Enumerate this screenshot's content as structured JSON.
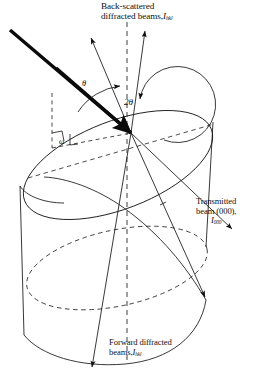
{
  "figure": {
    "background_color": "#ffffff",
    "line_color": "#101010",
    "width": 254,
    "height": 380
  },
  "labels": {
    "backscattered": {
      "line1": "Back-scattered",
      "line2": "diffracted beams,",
      "symbol": "I",
      "subscript": "hkl"
    },
    "transmitted": {
      "line1": "Transmitted",
      "line2": "beam (000),",
      "symbol": "I",
      "subscript": "000"
    },
    "forward": {
      "line1": "Forward diffracted",
      "line2": "beams,",
      "symbol": "I",
      "subscript": "hkl"
    }
  },
  "angles": {
    "theta": "θ",
    "two_theta": "2θ",
    "omega": "ω"
  },
  "beams": {
    "incident": {
      "name": "incident-beam",
      "style": "thick-solid-arrow",
      "from": [
        10,
        30
      ],
      "to": [
        131,
        133
      ]
    },
    "backscattered_left": {
      "name": "backscattered-beam-left",
      "style": "thin-solid-arrow",
      "from": [
        131,
        133
      ],
      "to": [
        91,
        38
      ]
    },
    "backscattered_right": {
      "name": "backscattered-beam-right",
      "style": "thin-solid-arrow",
      "from": [
        131,
        133
      ],
      "to": [
        145,
        31
      ]
    },
    "transmitted": {
      "name": "transmitted-beam-000",
      "style": "thin-solid-arrow",
      "from": [
        131,
        133
      ],
      "to": [
        232,
        229
      ]
    },
    "forward_diffracted_right": {
      "name": "forward-diffracted-beam-right",
      "style": "thin-solid-arrow",
      "from": [
        131,
        133
      ],
      "to": [
        205,
        297
      ]
    },
    "forward_diffracted_down": {
      "name": "forward-diffracted-beam-down",
      "style": "thin-solid-arrow",
      "from": [
        131,
        133
      ],
      "to": [
        92,
        367
      ]
    },
    "axis_vertical": {
      "name": "specimen-axis",
      "style": "dashed",
      "from": [
        127,
        22
      ],
      "to": [
        127,
        360
      ]
    }
  },
  "specimen": {
    "shape": "cylinder",
    "top_face": "inclined-ellipse",
    "hidden_edges": "dashed"
  }
}
